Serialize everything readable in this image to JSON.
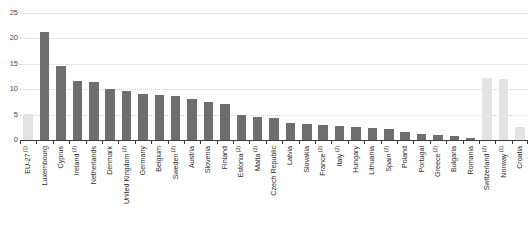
{
  "chart_data": {
    "type": "bar",
    "title": "",
    "subtitle": "",
    "xlabel": "",
    "ylabel": "",
    "ylim": [
      0,
      25
    ],
    "yticks": [
      0,
      5,
      10,
      15,
      20,
      25
    ],
    "grid": true,
    "legend": "none",
    "categories": [
      "EU-27",
      "Luxembourg",
      "Cyprus",
      "Ireland",
      "Netherlands",
      "Denmark",
      "United Kingdom",
      "Germany",
      "Belgium",
      "Sweden",
      "Austria",
      "Slovenia",
      "Finland",
      "Estonia",
      "Malta",
      "Czech Republic",
      "Latvia",
      "Slovakia",
      "France",
      "Italy",
      "Hungary",
      "Lithuania",
      "Spain",
      "Poland",
      "Portugal",
      "Greece",
      "Bulgaria",
      "Romania",
      "Switzerland",
      "Norway",
      "Croatia"
    ],
    "category_footnotes": [
      "1",
      "",
      "",
      "2",
      "",
      "",
      "2",
      "",
      "",
      "2",
      "",
      "",
      "",
      "2",
      "2",
      "",
      "",
      "",
      "2",
      "2",
      "",
      "",
      "2",
      "",
      "",
      "2",
      "",
      "",
      "2",
      "1",
      ""
    ],
    "values": [
      5.2,
      21.3,
      14.6,
      11.6,
      11.5,
      10.0,
      9.7,
      9.0,
      8.8,
      8.6,
      8.1,
      7.4,
      7.0,
      5.0,
      4.5,
      4.3,
      3.3,
      3.1,
      2.9,
      2.7,
      2.6,
      2.4,
      2.1,
      1.5,
      1.2,
      1.0,
      0.8,
      0.3,
      12.2,
      12.1,
      2.5
    ],
    "bar_styles": [
      "light",
      "dark",
      "dark",
      "dark",
      "dark",
      "dark",
      "dark",
      "dark",
      "dark",
      "dark",
      "dark",
      "dark",
      "dark",
      "dark",
      "dark",
      "dark",
      "dark",
      "dark",
      "dark",
      "dark",
      "dark",
      "dark",
      "dark",
      "dark",
      "dark",
      "dark",
      "dark",
      "dark",
      "light",
      "light",
      "light"
    ],
    "colors": {
      "bar_dark": "#6e6e6e",
      "bar_light": "#e3e3e3",
      "gridline": "#d5d5d5",
      "axis": "#3b3b3b",
      "text": "#2b2b2b",
      "tick_text": "#4a4a4a",
      "background": "#ffffff"
    }
  }
}
